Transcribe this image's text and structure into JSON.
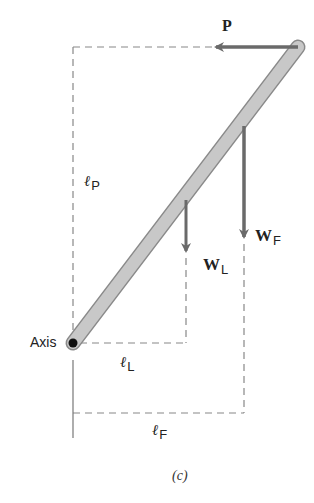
{
  "figure": {
    "caption": "(c)",
    "colors": {
      "rod_fill": "#c8c8c8",
      "rod_stroke": "#8a8a8a",
      "arrow": "#6a6a6a",
      "dashed": "#888888",
      "text": "#222222",
      "pivot": "#111111"
    }
  },
  "labels": {
    "force_p": "P",
    "weight_l": {
      "main": "W",
      "sub": "L"
    },
    "weight_f": {
      "main": "W",
      "sub": "F"
    },
    "axis": "Axis",
    "lever_p": {
      "main": "ℓ",
      "sub": "P"
    },
    "lever_l": {
      "main": "ℓ",
      "sub": "L"
    },
    "lever_f": {
      "main": "ℓ",
      "sub": "F"
    }
  }
}
